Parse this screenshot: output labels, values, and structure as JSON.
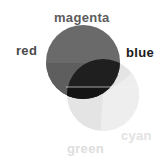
{
  "diagram": {
    "type": "venn",
    "labels": {
      "magenta": "magenta",
      "red": "red",
      "blue": "blue",
      "cyan": "cyan",
      "green": "green"
    },
    "colors": {
      "dark_circle": "#6a6a6a",
      "dark_circle_lower_band": "#5e5e5e",
      "light_circle": "#e4e4e4",
      "light_circle_right_band": "#eeeeee",
      "overlap": "#1f1f1f",
      "overlap_lower": "#141414",
      "label_magenta": "#5c5c5c",
      "label_red": "#4a4a4a",
      "label_blue": "#1a1a1a",
      "label_cyan": "#e2e2e2",
      "label_green": "#dedede"
    },
    "circles": [
      {
        "name": "upper-dark-circle",
        "cx": 83,
        "cy": 62,
        "r": 37
      },
      {
        "name": "lower-light-circle",
        "cx": 103,
        "cy": 95,
        "r": 36
      }
    ]
  }
}
